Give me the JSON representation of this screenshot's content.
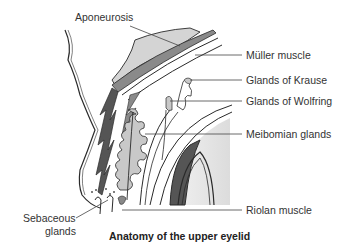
{
  "diagram": {
    "caption": "Anatomy of the upper eyelid",
    "labels": {
      "aponeurosis": "Aponeurosis",
      "muller_muscle": "Müller muscle",
      "glands_krause": "Glands of Krause",
      "glands_wolfring": "Glands of Wolfring",
      "meibomian_glands": "Meibomian glands",
      "riolan_muscle": "Riolan muscle",
      "sebaceous_line1": "Sebaceous",
      "sebaceous_line2": "glands"
    },
    "colors": {
      "outline": "#2a2a2a",
      "muscle_dark": "#555555",
      "muscle_mid": "#8a8a8a",
      "gland_fill": "#c8c8c8",
      "aponeurosis_fill": "#d4d4d4",
      "eye_shade": "#e6e6e6",
      "leader": "#444444"
    }
  }
}
